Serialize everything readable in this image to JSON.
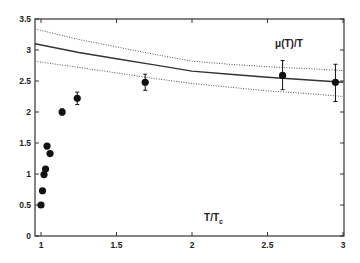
{
  "chart_data": {
    "type": "scatter",
    "title": "",
    "xlabel": "T/T_c",
    "ylabel": "",
    "xlim": [
      0.95,
      3.0
    ],
    "ylim": [
      0,
      3.5
    ],
    "x_ticks": [
      1,
      1.5,
      2,
      2.5,
      3
    ],
    "x_tick_labels": [
      "1",
      "1.5",
      "2",
      "2.5",
      "3"
    ],
    "y_ticks": [
      0,
      0.5,
      1,
      1.5,
      2,
      2.5,
      3,
      3.5
    ],
    "y_tick_labels": [
      "0",
      "0.5",
      "1",
      "1.5",
      "2",
      "2.5",
      "3",
      "3.5"
    ],
    "grid": false,
    "annotations": [
      {
        "text": "μ(T)/T",
        "x": 2.55,
        "y": 3.05
      },
      {
        "text": "T/T",
        "subscript": "c",
        "x": 2.08,
        "y": 0.3
      }
    ],
    "series": [
      {
        "name": "data points",
        "style": "markers-with-errorbars",
        "color": "#111111",
        "points": [
          {
            "x": 1.0,
            "y": 0.5,
            "err_lo": 0.46,
            "err_hi": 0.54
          },
          {
            "x": 1.01,
            "y": 0.73,
            "err_lo": 0.73,
            "err_hi": 0.73
          },
          {
            "x": 1.02,
            "y": 0.99,
            "err_lo": 0.99,
            "err_hi": 0.99
          },
          {
            "x": 1.03,
            "y": 1.08,
            "err_lo": 1.08,
            "err_hi": 1.08
          },
          {
            "x": 1.04,
            "y": 1.45,
            "err_lo": 1.45,
            "err_hi": 1.45
          },
          {
            "x": 1.06,
            "y": 1.33,
            "err_lo": 1.33,
            "err_hi": 1.33
          },
          {
            "x": 1.14,
            "y": 2.0,
            "err_lo": 1.95,
            "err_hi": 2.05
          },
          {
            "x": 1.24,
            "y": 2.22,
            "err_lo": 2.12,
            "err_hi": 2.32
          },
          {
            "x": 1.69,
            "y": 2.48,
            "err_lo": 2.35,
            "err_hi": 2.61
          },
          {
            "x": 2.6,
            "y": 2.59,
            "err_lo": 2.36,
            "err_hi": 2.83
          },
          {
            "x": 2.95,
            "y": 2.48,
            "err_lo": 2.17,
            "err_hi": 2.77
          }
        ]
      },
      {
        "name": "μ(T)/T central",
        "style": "solid-line",
        "color": "#333333",
        "x": [
          0.95,
          1.25,
          1.5,
          1.75,
          2.0,
          2.25,
          2.5,
          2.75,
          3.0
        ],
        "y": [
          3.1,
          2.96,
          2.86,
          2.76,
          2.66,
          2.61,
          2.56,
          2.52,
          2.48
        ]
      },
      {
        "name": "upper band",
        "style": "dotted-line",
        "color": "#555555",
        "x": [
          0.95,
          1.25,
          1.5,
          1.75,
          2.0,
          2.25,
          2.5,
          2.75,
          3.0
        ],
        "y": [
          3.34,
          3.17,
          3.05,
          2.93,
          2.82,
          2.77,
          2.73,
          2.7,
          2.67
        ]
      },
      {
        "name": "lower band",
        "style": "dotted-line",
        "color": "#555555",
        "x": [
          0.95,
          1.25,
          1.5,
          1.75,
          2.0,
          2.25,
          2.5,
          2.75,
          3.0
        ],
        "y": [
          2.82,
          2.72,
          2.63,
          2.54,
          2.46,
          2.4,
          2.34,
          2.3,
          2.25
        ]
      }
    ]
  },
  "layout": {
    "plot_left": 35,
    "plot_right": 344,
    "plot_top": 19,
    "plot_bottom": 236
  }
}
